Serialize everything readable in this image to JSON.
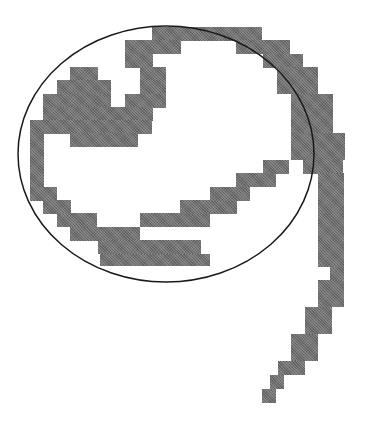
{
  "figure": {
    "fill_color": "#6e6e6e",
    "outline_color": "#1a1a1a",
    "ellipse": {
      "cx": 166,
      "cy": 154,
      "rx": 148,
      "ry": 128
    },
    "blocks": [
      [
        152,
        27,
        110,
        14
      ],
      [
        236,
        40,
        54,
        14
      ],
      [
        263,
        54,
        40,
        14
      ],
      [
        277,
        67,
        41,
        27
      ],
      [
        291,
        94,
        42,
        40
      ],
      [
        291,
        133,
        54,
        27
      ],
      [
        303,
        160,
        40,
        14
      ],
      [
        125,
        40,
        56,
        14
      ],
      [
        125,
        54,
        28,
        14
      ],
      [
        70,
        67,
        28,
        14
      ],
      [
        140,
        67,
        26,
        14
      ],
      [
        57,
        80,
        54,
        14
      ],
      [
        140,
        80,
        26,
        14
      ],
      [
        43,
        94,
        68,
        14
      ],
      [
        125,
        94,
        41,
        14
      ],
      [
        43,
        107,
        110,
        14
      ],
      [
        30,
        120,
        122,
        14
      ],
      [
        30,
        133,
        14,
        54
      ],
      [
        70,
        133,
        68,
        14
      ],
      [
        30,
        187,
        27,
        14
      ],
      [
        43,
        200,
        28,
        14
      ],
      [
        57,
        213,
        40,
        14
      ],
      [
        70,
        227,
        70,
        14
      ],
      [
        98,
        240,
        103,
        14
      ],
      [
        100,
        254,
        110,
        12
      ],
      [
        140,
        213,
        70,
        14
      ],
      [
        180,
        200,
        57,
        14
      ],
      [
        210,
        187,
        40,
        14
      ],
      [
        236,
        173,
        40,
        14
      ],
      [
        263,
        160,
        26,
        14
      ],
      [
        318,
        173,
        26,
        40
      ],
      [
        318,
        213,
        26,
        54
      ],
      [
        330,
        267,
        14,
        20
      ],
      [
        318,
        280,
        26,
        27
      ],
      [
        305,
        307,
        27,
        27
      ],
      [
        291,
        334,
        27,
        27
      ],
      [
        278,
        361,
        27,
        14
      ],
      [
        270,
        375,
        14,
        14
      ],
      [
        262,
        389,
        14,
        14
      ]
    ]
  }
}
